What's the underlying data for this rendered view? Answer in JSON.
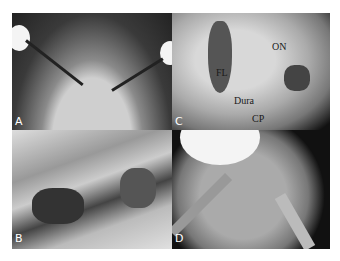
{
  "figure": {
    "panels": [
      {
        "id": "A",
        "label": "A",
        "description": "Patient positioned with head retracted, nasal approach with instruments"
      },
      {
        "id": "B",
        "label": "B",
        "description": "Endoscopic view of nasal cavity mucosa"
      },
      {
        "id": "C",
        "label": "C",
        "description": "Surgical field with annotated structures",
        "annotations": [
          "FL",
          "ON",
          "Dura",
          "CP"
        ]
      },
      {
        "id": "D",
        "label": "D",
        "description": "Endoscopic view with instruments and sutures"
      }
    ]
  }
}
